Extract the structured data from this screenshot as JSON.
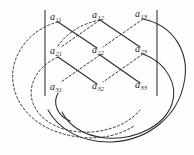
{
  "figure": {
    "name": "sarrus-rule-3x3-determinant-diagram",
    "colors": {
      "background": "#fefefe",
      "ink": "#1a1a1a",
      "solid_line": "#2a2a2a",
      "dashed_line": "#3a3a3a",
      "bar": "#555555"
    }
  },
  "matrix": {
    "left_bar": "|",
    "right_bar": "|",
    "rows": [
      [
        {
          "base": "a",
          "sub": "11",
          "x": 50,
          "y": 12
        },
        {
          "base": "a",
          "sub": "12",
          "x": 92,
          "y": 10
        },
        {
          "base": "a",
          "sub": "13",
          "x": 135,
          "y": 9
        }
      ],
      [
        {
          "base": "a",
          "sub": "21",
          "x": 50,
          "y": 46
        },
        {
          "base": "a",
          "sub": "22",
          "x": 92,
          "y": 45
        },
        {
          "base": "a",
          "sub": "23",
          "x": 135,
          "y": 44
        }
      ],
      [
        {
          "base": "a",
          "sub": "31",
          "x": 50,
          "y": 82
        },
        {
          "base": "a",
          "sub": "32",
          "x": 92,
          "y": 81
        },
        {
          "base": "a",
          "sub": "33",
          "x": 135,
          "y": 80
        }
      ]
    ]
  },
  "nodes": {
    "a11": {
      "x": 58,
      "y": 18
    },
    "a12": {
      "x": 100,
      "y": 16
    },
    "a13": {
      "x": 143,
      "y": 15
    },
    "a21": {
      "x": 58,
      "y": 52
    },
    "a22": {
      "x": 100,
      "y": 51
    },
    "a23": {
      "x": 143,
      "y": 50
    },
    "a31": {
      "x": 58,
      "y": 88
    },
    "a32": {
      "x": 100,
      "y": 87
    },
    "a33": {
      "x": 143,
      "y": 86
    }
  },
  "bars": {
    "left": {
      "x": 45,
      "y1": 10,
      "y2": 96
    },
    "right": {
      "x": 157,
      "y1": 10,
      "y2": 96
    }
  },
  "solid_paths": [
    "M58,22 L97,48",
    "M100,20 L140,47",
    "M58,57 L97,84",
    "M100,55 L140,83",
    "M143,19 C176,26 190,55 184,83 C178,115 150,140 112,142 C80,143 58,128 48,110",
    "M143,54 C168,63 178,86 172,104 C164,126 136,140 106,138 C82,136 68,124 62,112",
    "M58,93 C52,104 58,116 70,121"
  ],
  "dashed_paths": [
    "M143,19 L103,47",
    "M100,20 L61,47",
    "M143,54 L103,82",
    "M100,55 L61,82",
    "M58,22 C34,28 16,48 13,70 C10,96 26,119 52,130 C82,142 112,140 134,126",
    "M58,57 C38,66 28,84 32,100 C38,122 64,134 92,132 C114,130 130,122 140,110",
    "M100,20 C80,24 66,34 58,46"
  ],
  "accessible_text": {
    "title": "Rule of Sarrus diagram",
    "legend_solid": "solid diagonals: positive products",
    "legend_dashed": "dashed diagonals: negative products"
  }
}
